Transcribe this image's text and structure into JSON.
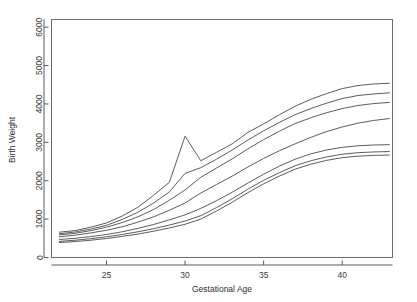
{
  "chart_data": {
    "type": "line",
    "title": "",
    "subtitle": "",
    "xlabel": "Gestational Age",
    "ylabel": "Birth Weight",
    "xlim": [
      21.5,
      43.2
    ],
    "ylim": [
      0,
      6200
    ],
    "xticks": [
      25,
      30,
      35,
      40
    ],
    "yticks": [
      0,
      1000,
      2000,
      3000,
      4000,
      5000,
      6000
    ],
    "xtick_labels": [
      "25",
      "30",
      "35",
      "40"
    ],
    "ytick_labels": [
      "0",
      "1000",
      "2000",
      "3000",
      "4000",
      "5000",
      "6000"
    ],
    "grid": false,
    "legend": null,
    "legend_position": "none",
    "annotations": [],
    "x": [
      22,
      23,
      24,
      25,
      26,
      27,
      28,
      29,
      30,
      31,
      32,
      33,
      34,
      35,
      36,
      37,
      38,
      39,
      40,
      41,
      42,
      43
    ],
    "series": [
      {
        "name": "p97",
        "values": [
          660,
          700,
          790,
          900,
          1080,
          1310,
          1620,
          1960,
          3160,
          2520,
          2740,
          2960,
          3260,
          3480,
          3720,
          3940,
          4120,
          4270,
          4400,
          4480,
          4520,
          4540
        ]
      },
      {
        "name": "p90",
        "values": [
          620,
          665,
          740,
          840,
          990,
          1180,
          1420,
          1710,
          2190,
          2340,
          2560,
          2800,
          3060,
          3300,
          3520,
          3720,
          3880,
          4020,
          4140,
          4220,
          4260,
          4290
        ]
      },
      {
        "name": "p75",
        "values": [
          590,
          630,
          700,
          790,
          910,
          1060,
          1250,
          1490,
          1760,
          2090,
          2330,
          2570,
          2830,
          3070,
          3290,
          3490,
          3640,
          3770,
          3880,
          3960,
          4010,
          4040
        ]
      },
      {
        "name": "p50",
        "values": [
          540,
          580,
          640,
          710,
          800,
          920,
          1060,
          1230,
          1420,
          1680,
          1900,
          2120,
          2360,
          2580,
          2780,
          2960,
          3130,
          3280,
          3400,
          3500,
          3570,
          3620
        ]
      },
      {
        "name": "p25",
        "values": [
          470,
          500,
          545,
          600,
          670,
          760,
          860,
          980,
          1110,
          1280,
          1480,
          1700,
          1940,
          2170,
          2380,
          2560,
          2700,
          2800,
          2870,
          2910,
          2930,
          2940
        ]
      },
      {
        "name": "p10",
        "values": [
          420,
          450,
          490,
          540,
          600,
          670,
          750,
          845,
          950,
          1090,
          1300,
          1530,
          1780,
          2010,
          2210,
          2390,
          2520,
          2620,
          2690,
          2730,
          2750,
          2760
        ]
      },
      {
        "name": "p3",
        "values": [
          390,
          415,
          450,
          495,
          550,
          610,
          685,
          770,
          865,
          1000,
          1210,
          1440,
          1690,
          1920,
          2120,
          2300,
          2430,
          2530,
          2600,
          2640,
          2660,
          2670
        ]
      }
    ]
  },
  "axes": {
    "x_title": "Gestational Age",
    "y_title": "Birth Weight"
  }
}
